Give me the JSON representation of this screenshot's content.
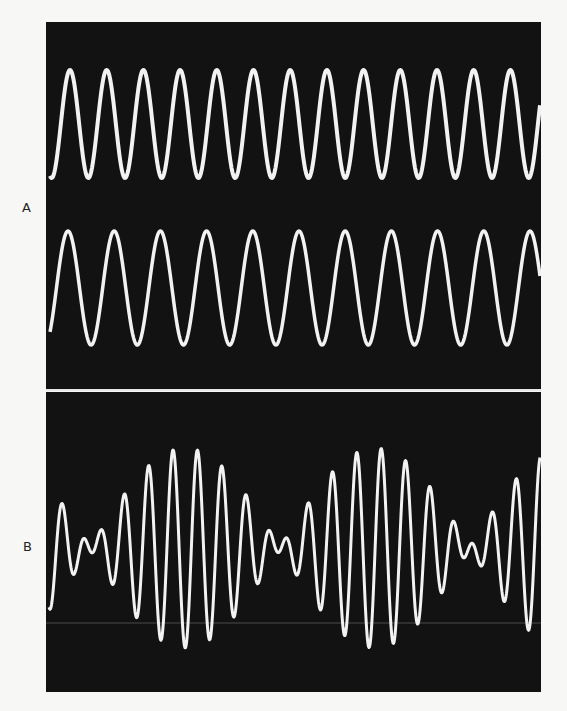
{
  "figure": {
    "width": 567,
    "height": 711,
    "background": "#f7f7f5",
    "screen_color": "#121212",
    "trace_color": "#f2f2f2",
    "divider_color": "#e8e8e8",
    "faint_line_color": "#5a5a5a"
  },
  "panels": {
    "a": {
      "label": "A",
      "box": {
        "x": 46,
        "y": 22,
        "w": 495,
        "h": 368
      },
      "waves": [
        {
          "name": "higher-frequency-tone",
          "center_y": 124,
          "amplitude": 54,
          "period": 36.7,
          "peak_x": 70,
          "stroke": 4,
          "peaks_visible": 13
        },
        {
          "name": "lower-frequency-tone",
          "center_y": 288,
          "amplitude": 57,
          "period": 46.2,
          "peak_x": 68,
          "stroke": 3.5,
          "peaks_visible": 11
        }
      ]
    },
    "divider": {
      "y": 390,
      "thickness": 2
    },
    "b": {
      "label": "B",
      "box": {
        "x": 46,
        "y": 392,
        "w": 495,
        "h": 300
      },
      "beat": {
        "center_y": 548,
        "carrier_period": 24.5,
        "carrier_peak_x": 173,
        "beat_period": 190,
        "node_x": 280,
        "amplitude_1": 52,
        "amplitude_2": 48,
        "stroke": 3
      },
      "faint_line_y": 623
    }
  },
  "chart_data": {
    "type": "line",
    "title": "",
    "panels": [
      {
        "label": "A",
        "description": "Two pure sine tones of slightly different frequency",
        "series": [
          {
            "name": "tone 1",
            "cycles_visible": 13,
            "period_px": 36.7
          },
          {
            "name": "tone 2",
            "cycles_visible": 11,
            "period_px": 46.2
          }
        ]
      },
      {
        "label": "B",
        "description": "Superposition producing beats",
        "series": [
          {
            "name": "sum (beats)",
            "carrier_period_px": 24.5,
            "beat_period_px": 190,
            "envelope_nodes_x": [
              89,
              280,
              470
            ],
            "envelope_max_x": [
              185,
              375
            ]
          }
        ]
      }
    ],
    "xlabel": "",
    "ylabel": ""
  }
}
